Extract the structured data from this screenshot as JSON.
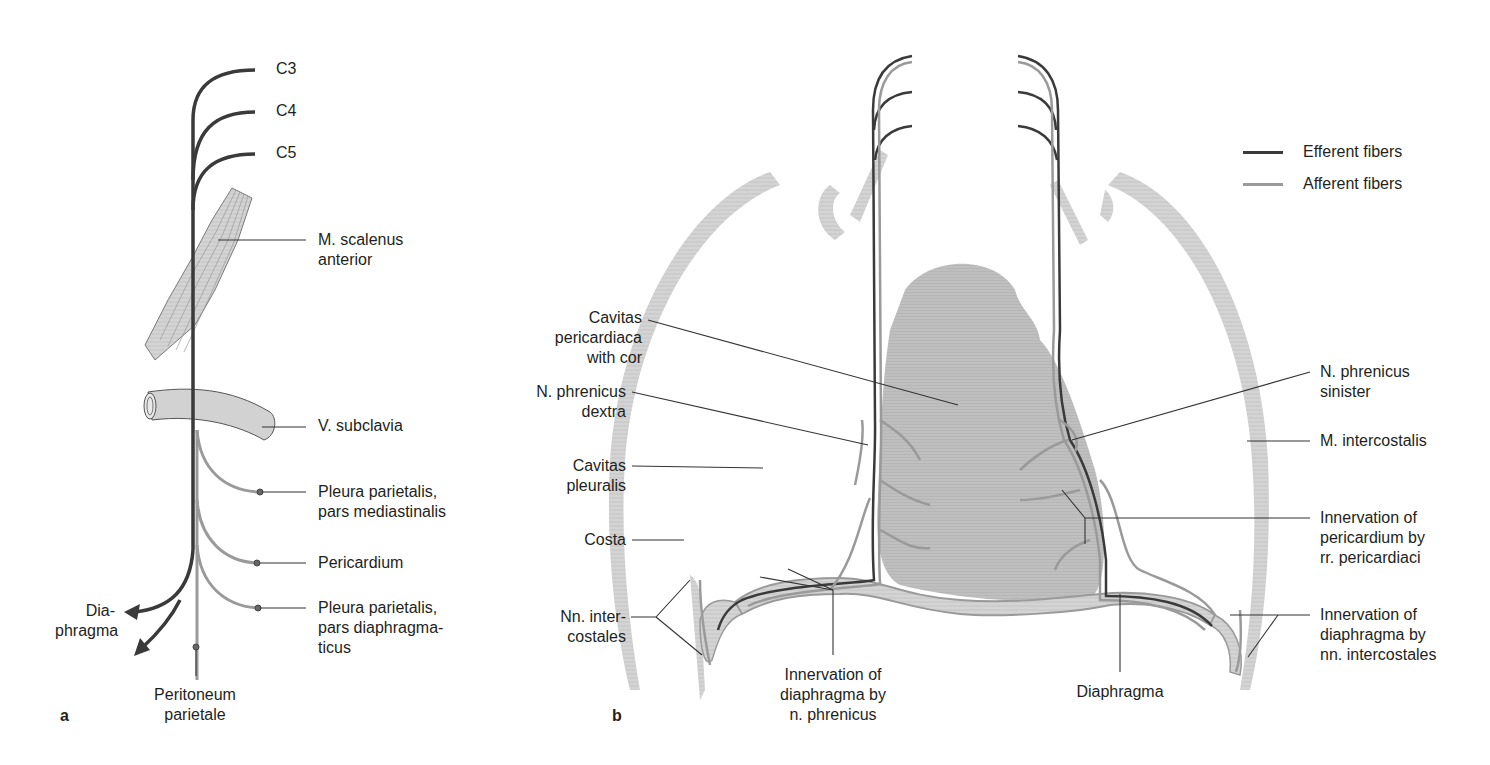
{
  "colors": {
    "efferent": "#3a3a3a",
    "afferent": "#9a9a9a",
    "tissue_fill": "#c8c8c8",
    "rib_fill": "#dcdcdc",
    "heart_fill": "#bdbdbd"
  },
  "legend": {
    "items": [
      {
        "label": "Efferent fibers",
        "color": "#3a3a3a"
      },
      {
        "label": "Afferent fibers",
        "color": "#9a9a9a"
      }
    ]
  },
  "panel_a": {
    "panel_label": "a",
    "roots": [
      "C3",
      "C4",
      "C5"
    ],
    "labels": {
      "scalenus_1": "M. scalenus",
      "scalenus_2": "anterior",
      "subclavia": "V. subclavia",
      "pleura_med_1": "Pleura parietalis,",
      "pleura_med_2": "pars mediastinalis",
      "pericardium": "Pericardium",
      "pleura_dia_1": "Pleura parietalis,",
      "pleura_dia_2": "pars diaphragma-",
      "pleura_dia_3": "ticus",
      "diaphragma_1": "Dia-",
      "diaphragma_2": "phragma",
      "peritoneum_1": "Peritoneum",
      "peritoneum_2": "parietale"
    }
  },
  "panel_b": {
    "panel_label": "b",
    "labels": {
      "cav_peri_1": "Cavitas",
      "cav_peri_2": "pericardiaca",
      "cav_peri_3": "with cor",
      "phren_dex_1": "N. phrenicus",
      "phren_dex_2": "dextra",
      "cav_pleu_1": "Cavitas",
      "cav_pleu_2": "pleuralis",
      "costa": "Costa",
      "nn_inter_1": "Nn. inter-",
      "nn_inter_2": "costales",
      "inn_phren_1": "Innervation of",
      "inn_phren_2": "diaphragma by",
      "inn_phren_3": "n. phrenicus",
      "diaphragma": "Diaphragma",
      "phren_sin_1": "N. phrenicus",
      "phren_sin_2": "sinister",
      "m_intercost": "M. intercostalis",
      "inn_peri_1": "Innervation of",
      "inn_peri_2": "pericardium by",
      "inn_peri_3": "rr. pericardiaci",
      "inn_dia_1": "Innervation of",
      "inn_dia_2": "diaphragma by",
      "inn_dia_3": "nn. intercostales"
    }
  }
}
